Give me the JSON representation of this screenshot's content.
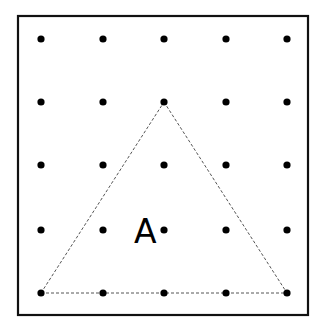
{
  "diagram": {
    "type": "geoboard",
    "grid": {
      "rows": 5,
      "cols": 5
    },
    "shape": {
      "kind": "triangle",
      "line_style": "dashed",
      "vertices": [
        {
          "col": 0,
          "row": 4
        },
        {
          "col": 2,
          "row": 1
        },
        {
          "col": 4,
          "row": 4
        }
      ]
    },
    "label": "A",
    "colors": {
      "border": "#111111",
      "dot": "#000000",
      "dashed_line": "#555555",
      "label": "#000000",
      "background": "#ffffff"
    }
  }
}
